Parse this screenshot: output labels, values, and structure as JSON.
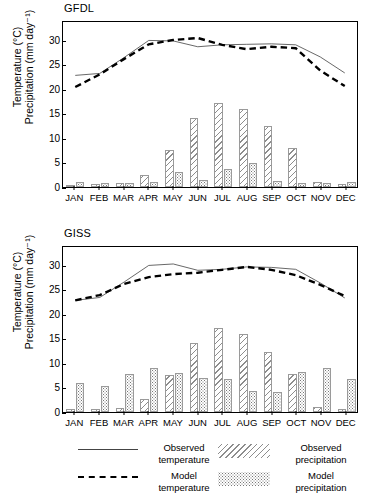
{
  "figure": {
    "axis_label_line1": "Temperature (°C)",
    "axis_label_line2": "Precipitation (mm day⁻¹)"
  },
  "legend": {
    "items": [
      {
        "name": "observed-temperature",
        "label": "Observed\ntemperature",
        "swatch": "solid-line"
      },
      {
        "name": "observed-precipitation",
        "label": "Observed\nprecipitation",
        "swatch": "hatch-fill"
      },
      {
        "name": "model-temperature",
        "label": "Model\ntemperature",
        "swatch": "dashed-line"
      },
      {
        "name": "model-precipitation",
        "label": "Model\nprecipitation",
        "swatch": "dotted-fill"
      }
    ]
  },
  "chart_data": [
    {
      "type": "line",
      "title": "GFDL",
      "xlabel": "",
      "ylabel": "Temperature (°C)  Precipitation (mm day⁻¹)",
      "categories": [
        "JAN",
        "FEB",
        "MAR",
        "APR",
        "MAY",
        "JUN",
        "JUL",
        "AUG",
        "SEP",
        "OCT",
        "NOV",
        "DEC"
      ],
      "ylim": [
        0,
        34
      ],
      "yticks": [
        0,
        5,
        10,
        15,
        20,
        25,
        30
      ],
      "grid": false,
      "legend_position": "below-figure",
      "series": [
        {
          "name": "Observed temperature",
          "style": "solid-line",
          "values": [
            23.0,
            23.4,
            26.7,
            30.2,
            30.1,
            28.9,
            29.3,
            29.4,
            29.5,
            29.3,
            26.8,
            23.5
          ]
        },
        {
          "name": "Model temperature",
          "style": "dashed-line",
          "values": [
            20.6,
            23.2,
            26.4,
            29.4,
            30.3,
            30.7,
            29.3,
            28.4,
            28.9,
            28.6,
            24.0,
            20.8
          ]
        },
        {
          "name": "Observed precipitation",
          "style": "hatched-bar",
          "values": [
            0.5,
            0.6,
            0.8,
            2.5,
            7.6,
            14.1,
            17.2,
            15.9,
            12.5,
            7.9,
            1.0,
            0.6
          ]
        },
        {
          "name": "Model precipitation",
          "style": "dotted-bar",
          "values": [
            1.0,
            0.9,
            0.8,
            1.1,
            3.0,
            1.5,
            3.6,
            4.9,
            1.2,
            0.9,
            0.9,
            1.1
          ]
        }
      ]
    },
    {
      "type": "line",
      "title": "GISS",
      "xlabel": "",
      "ylabel": "Temperature (°C)  Precipitation (mm day⁻¹)",
      "categories": [
        "JAN",
        "FEB",
        "MAR",
        "APR",
        "MAY",
        "JUN",
        "JUL",
        "AUG",
        "SEP",
        "OCT",
        "NOV",
        "DEC"
      ],
      "ylim": [
        0,
        34
      ],
      "yticks": [
        0,
        5,
        10,
        15,
        20,
        25,
        30
      ],
      "grid": false,
      "legend_position": "below-figure",
      "series": [
        {
          "name": "Observed temperature",
          "style": "solid-line",
          "values": [
            23.0,
            23.6,
            26.8,
            30.2,
            30.5,
            29.2,
            29.4,
            29.9,
            29.8,
            29.4,
            26.6,
            23.5
          ]
        },
        {
          "name": "Model temperature",
          "style": "dashed-line",
          "values": [
            23.0,
            24.1,
            26.4,
            27.8,
            28.4,
            28.7,
            29.3,
            29.9,
            29.3,
            28.2,
            26.2,
            23.9
          ]
        },
        {
          "name": "Observed precipitation",
          "style": "hatched-bar",
          "values": [
            0.6,
            0.7,
            0.8,
            2.6,
            7.5,
            14.0,
            17.1,
            15.9,
            12.3,
            7.8,
            1.0,
            0.7
          ]
        },
        {
          "name": "Model precipitation",
          "style": "dotted-bar",
          "values": [
            6.0,
            5.3,
            7.8,
            9.0,
            7.9,
            6.9,
            6.7,
            4.2,
            4.0,
            8.2,
            9.0,
            6.7
          ]
        }
      ]
    }
  ]
}
